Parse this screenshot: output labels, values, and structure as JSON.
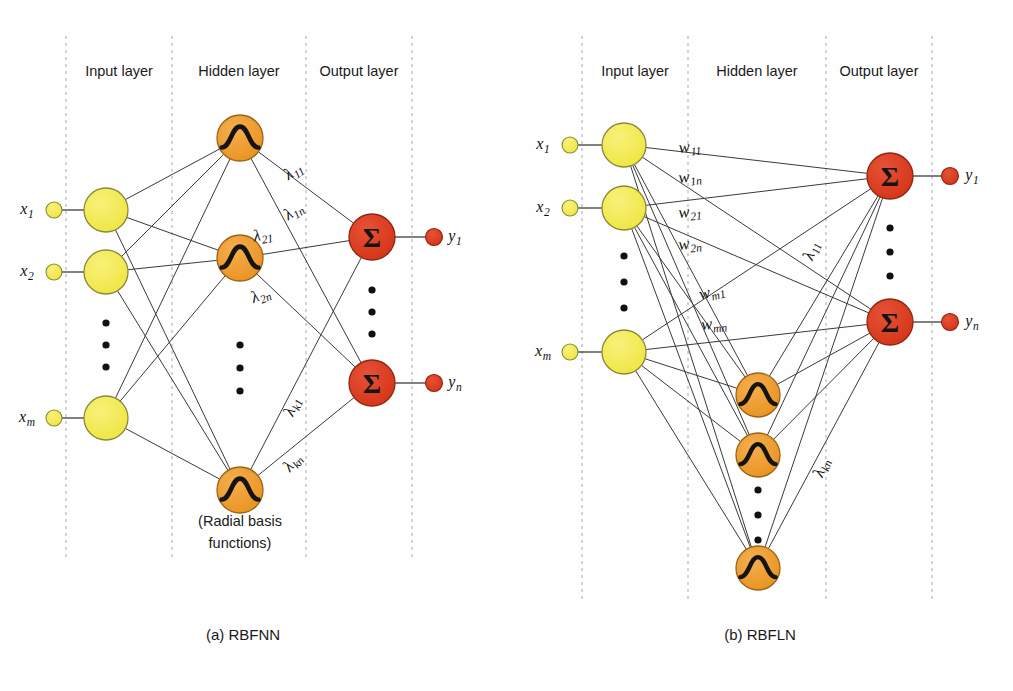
{
  "figure": {
    "background": "#fefefe"
  },
  "colors": {
    "input_node": "#F2E84B",
    "input_node_stroke": "#8a8a3a",
    "hidden_node": "#EE9A2E",
    "hidden_node_stroke": "#9a6418",
    "output_node": "#D93B1E",
    "output_node_stroke": "#8e2612",
    "edge": "#3a3a3a",
    "divider": "#c9c9c9",
    "text": "#1a1a1a"
  },
  "glyphs": {
    "rbf": "radial-basis-bell-glyph",
    "sum": "Σ"
  },
  "panels": [
    {
      "id": "rbfnn",
      "caption": "(a) RBFNN",
      "caption_pos": {
        "x": 243,
        "y": 636
      },
      "layer_labels": [
        {
          "text": "Input layer",
          "x": 119,
          "y": 72
        },
        {
          "text": "Hidden layer",
          "x": 239,
          "y": 72
        },
        {
          "text": "Output layer",
          "x": 359,
          "y": 72
        }
      ],
      "dividers": [
        66,
        172,
        306,
        412
      ],
      "divider_top": 36,
      "divider_bottom": 560,
      "note": {
        "line1": "(Radial basis",
        "line2": "functions)",
        "x": 240,
        "y": 522
      },
      "input_nodes": [
        {
          "label": "x",
          "sub": "1",
          "stub_x": 54,
          "cx": 106,
          "cy": 210,
          "r": 22,
          "label_x": 27,
          "label_y": 210
        },
        {
          "label": "x",
          "sub": "2",
          "stub_x": 54,
          "cx": 106,
          "cy": 272,
          "r": 22,
          "label_x": 27,
          "label_y": 272
        },
        {
          "label": "x",
          "sub": "m",
          "stub_x": 54,
          "cx": 106,
          "cy": 418,
          "r": 22,
          "label_x": 27,
          "label_y": 418
        }
      ],
      "input_ellipsis": [
        {
          "x": 106,
          "y": 323
        },
        {
          "x": 106,
          "y": 345
        },
        {
          "x": 106,
          "y": 367
        }
      ],
      "hidden_nodes": [
        {
          "cx": 240,
          "cy": 138,
          "r": 23
        },
        {
          "cx": 240,
          "cy": 258,
          "r": 23
        },
        {
          "cx": 240,
          "cy": 490,
          "r": 23
        }
      ],
      "hidden_ellipsis": [
        {
          "x": 240,
          "y": 345
        },
        {
          "x": 240,
          "y": 368
        },
        {
          "x": 240,
          "y": 391
        }
      ],
      "output_nodes": [
        {
          "label": "y",
          "sub": "1",
          "cx": 372,
          "cy": 237,
          "r": 23,
          "stub_x": 434,
          "label_x": 455,
          "label_y": 237
        },
        {
          "label": "y",
          "sub": "n",
          "cx": 372,
          "cy": 383,
          "r": 23,
          "stub_x": 434,
          "label_x": 455,
          "label_y": 383
        }
      ],
      "output_ellipsis": [
        {
          "x": 372,
          "y": 290
        },
        {
          "x": 372,
          "y": 312
        },
        {
          "x": 372,
          "y": 334
        }
      ],
      "weight_labels": [
        {
          "base": "λ",
          "sub": "11",
          "x": 294,
          "y": 172,
          "rot": -34
        },
        {
          "base": "λ",
          "sub": "1n",
          "x": 294,
          "y": 212,
          "rot": -34
        },
        {
          "base": "λ",
          "sub": "21",
          "x": 263,
          "y": 236,
          "rot": -10
        },
        {
          "base": "λ",
          "sub": "2n",
          "x": 261,
          "y": 296,
          "rot": -22
        },
        {
          "base": "λ",
          "sub": "k1",
          "x": 293,
          "y": 407,
          "rot": -68
        },
        {
          "base": "λ",
          "sub": "kn",
          "x": 293,
          "y": 463,
          "rot": -50
        }
      ]
    },
    {
      "id": "rbfln",
      "caption": "(b) RBFLN",
      "caption_pos": {
        "x": 760,
        "y": 636
      },
      "layer_labels": [
        {
          "text": "Input layer",
          "x": 635,
          "y": 72
        },
        {
          "text": "Hidden layer",
          "x": 757,
          "y": 72
        },
        {
          "text": "Output layer",
          "x": 879,
          "y": 72
        }
      ],
      "dividers": [
        582,
        688,
        826,
        932
      ],
      "divider_top": 36,
      "divider_bottom": 600,
      "input_nodes": [
        {
          "label": "x",
          "sub": "1",
          "stub_x": 570,
          "cx": 624,
          "cy": 145,
          "r": 22,
          "label_x": 543,
          "label_y": 145
        },
        {
          "label": "x",
          "sub": "2",
          "stub_x": 570,
          "cx": 624,
          "cy": 208,
          "r": 22,
          "label_x": 543,
          "label_y": 208
        },
        {
          "label": "x",
          "sub": "m",
          "stub_x": 570,
          "cx": 624,
          "cy": 352,
          "r": 22,
          "label_x": 543,
          "label_y": 352
        }
      ],
      "input_ellipsis": [
        {
          "x": 624,
          "y": 256
        },
        {
          "x": 624,
          "y": 282
        },
        {
          "x": 624,
          "y": 308
        }
      ],
      "hidden_nodes": [
        {
          "cx": 758,
          "cy": 395,
          "r": 22
        },
        {
          "cx": 758,
          "cy": 455,
          "r": 22
        },
        {
          "cx": 758,
          "cy": 568,
          "r": 22
        }
      ],
      "hidden_ellipsis": [
        {
          "x": 758,
          "y": 490
        },
        {
          "x": 758,
          "y": 515
        },
        {
          "x": 758,
          "y": 540
        }
      ],
      "output_nodes": [
        {
          "label": "y",
          "sub": "1",
          "cx": 890,
          "cy": 176,
          "r": 23,
          "stub_x": 950,
          "label_x": 972,
          "label_y": 176
        },
        {
          "label": "y",
          "sub": "n",
          "cx": 890,
          "cy": 322,
          "r": 23,
          "stub_x": 950,
          "label_x": 972,
          "label_y": 322
        }
      ],
      "output_ellipsis": [
        {
          "x": 890,
          "y": 228
        },
        {
          "x": 890,
          "y": 252
        },
        {
          "x": 890,
          "y": 276
        }
      ],
      "weight_labels": [
        {
          "base": "w",
          "sub": "11",
          "x": 690,
          "y": 148,
          "rot": -6
        },
        {
          "base": "w",
          "sub": "1n",
          "x": 690,
          "y": 178,
          "rot": -6
        },
        {
          "base": "w",
          "sub": "21",
          "x": 690,
          "y": 213,
          "rot": -6
        },
        {
          "base": "w",
          "sub": "2n",
          "x": 690,
          "y": 245,
          "rot": -6
        },
        {
          "base": "w",
          "sub": "m1",
          "x": 712,
          "y": 293,
          "rot": -14
        },
        {
          "base": "w",
          "sub": "mn",
          "x": 714,
          "y": 325,
          "rot": -6
        },
        {
          "base": "λ",
          "sub": "11",
          "x": 812,
          "y": 251,
          "rot": -70
        },
        {
          "base": "λ",
          "sub": "kn",
          "x": 822,
          "y": 468,
          "rot": -70
        }
      ]
    }
  ]
}
